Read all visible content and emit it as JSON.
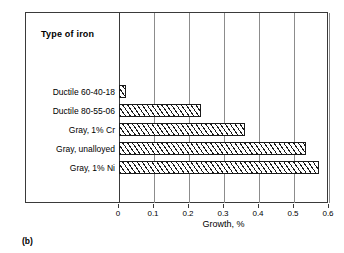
{
  "caption": "(b)",
  "header": {
    "column_title": "Type of iron"
  },
  "chart_data": {
    "type": "bar",
    "orientation": "horizontal",
    "title": "",
    "xlabel": "Growth, %",
    "ylabel": "Type of iron",
    "xlim": [
      0,
      0.6
    ],
    "xticks": [
      0,
      0.1,
      0.2,
      0.3,
      0.4,
      0.5,
      0.6
    ],
    "xticklabels": [
      "0",
      "0.1",
      "0.2",
      "0.3",
      "0.4",
      "0.5",
      "0.6"
    ],
    "grid": true,
    "legend": false,
    "bar_style": {
      "fill": "#ffffff",
      "edge": "#1a1a1a",
      "hatch": "diagonal"
    },
    "categories": [
      "Ductile 60-40-18",
      "Ductile 80-55-06",
      "Gray, 1% Cr",
      "Gray, unalloyed",
      "Gray, 1% Ni"
    ],
    "values": [
      0.02,
      0.235,
      0.36,
      0.535,
      0.57
    ]
  }
}
